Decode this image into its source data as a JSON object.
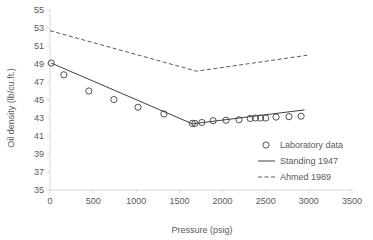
{
  "chart_data": {
    "type": "scatter",
    "title": "",
    "xlabel": "Pressure (psig)",
    "ylabel": "Oil density (lb/cu.ft.)",
    "xlim": [
      0,
      3500
    ],
    "ylim": [
      35,
      55
    ],
    "xticks": [
      0,
      500,
      1000,
      1500,
      2000,
      2500,
      3000,
      3500
    ],
    "yticks": [
      35,
      37,
      39,
      41,
      43,
      45,
      47,
      49,
      51,
      53,
      55
    ],
    "xtick_labels": [
      "0",
      "500",
      "1000",
      "1500",
      "2000",
      "2500",
      "3000",
      "3500"
    ],
    "ytick_labels": [
      "35",
      "37",
      "39",
      "41",
      "43",
      "45",
      "47",
      "49",
      "51",
      "53",
      "55"
    ],
    "grid": false,
    "legend_position": "inside-lower-right",
    "series": [
      {
        "name": "Laboratory data",
        "marker": "open-circle",
        "style": "markers",
        "color": "#404040",
        "points": [
          [
            15,
            49.1
          ],
          [
            160,
            47.8
          ],
          [
            450,
            46.0
          ],
          [
            740,
            45.05
          ],
          [
            1020,
            44.2
          ],
          [
            1320,
            43.45
          ],
          [
            1650,
            42.4
          ],
          [
            1680,
            42.4
          ],
          [
            1760,
            42.5
          ],
          [
            1890,
            42.7
          ],
          [
            2040,
            42.75
          ],
          [
            2190,
            42.8
          ],
          [
            2320,
            42.95
          ],
          [
            2380,
            43.0
          ],
          [
            2440,
            43.0
          ],
          [
            2500,
            43.0
          ],
          [
            2620,
            43.1
          ],
          [
            2770,
            43.15
          ],
          [
            2910,
            43.2
          ]
        ]
      },
      {
        "name": "Standing 1947",
        "marker": "none",
        "style": "solid-line",
        "color": "#404040",
        "points": [
          [
            15,
            49.1
          ],
          [
            1650,
            42.35
          ],
          [
            2950,
            43.9
          ]
        ]
      },
      {
        "name": "Ahmed 1989",
        "marker": "none",
        "style": "dashed-line",
        "color": "#595959",
        "points": [
          [
            0,
            52.7
          ],
          [
            1700,
            48.2
          ],
          [
            3000,
            50.0
          ]
        ]
      }
    ]
  },
  "legend": {
    "entries": [
      {
        "label": "Laboratory data",
        "style": "open-circle"
      },
      {
        "label": "Standing 1947",
        "style": "solid-line"
      },
      {
        "label": "Ahmed 1989",
        "style": "dashed-line"
      }
    ]
  },
  "colors": {
    "text": "#595959",
    "axis": "#d9d9d9",
    "series_line": "#404040",
    "dashed_line": "#595959",
    "background": "#ffffff"
  }
}
